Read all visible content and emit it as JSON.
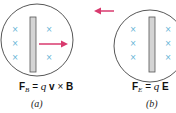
{
  "colors": {
    "circle_stroke": "#444444",
    "bar_fill": "#d4d4d4",
    "bar_stroke": "#555555",
    "cross": "#5fb3d6",
    "arrow": "#d83a6e"
  },
  "panels": [
    {
      "id": "a",
      "caption": "(a)",
      "equation": {
        "force": "F",
        "subscript": "B",
        "eq": "=",
        "charge": "q",
        "velocity": "v",
        "op": "×",
        "field": "B"
      },
      "arrow_direction": "right"
    },
    {
      "id": "b",
      "caption": "(b)",
      "equation": {
        "force": "F",
        "subscript": "E",
        "eq": "=",
        "charge": "q",
        "field": "E"
      },
      "arrow_direction": "left"
    }
  ],
  "icons": {
    "cross": "×"
  }
}
